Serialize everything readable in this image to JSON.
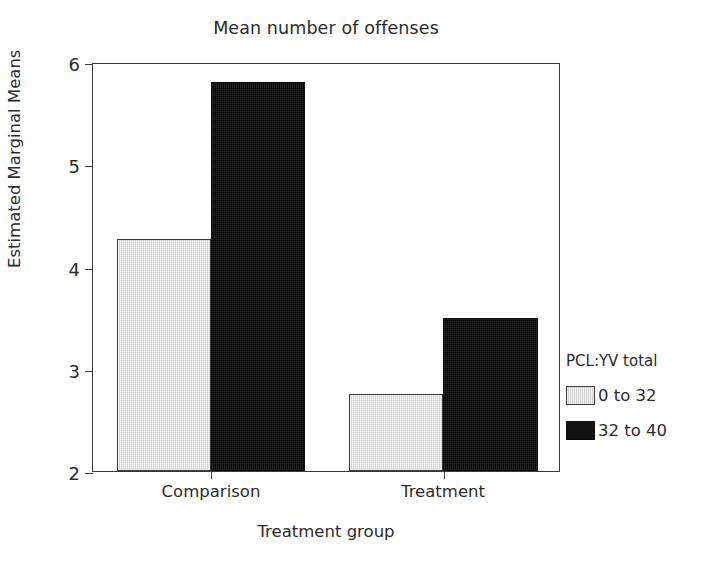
{
  "chart_data": {
    "type": "bar",
    "title": "Mean number of offenses",
    "xlabel": "Treatment group",
    "ylabel": "Estimated Marginal Means",
    "categories": [
      "Comparison",
      "Treatment"
    ],
    "series": [
      {
        "name": "0 to 32",
        "color": "#dcdcdc",
        "values": [
          4.27,
          2.75
        ]
      },
      {
        "name": "32 to 40",
        "color": "#121212",
        "values": [
          5.8,
          3.5
        ]
      }
    ],
    "legend_title": "PCL:YV total",
    "legend_position": "right",
    "ylim": [
      2,
      6
    ],
    "yticks": [
      2,
      3,
      4,
      5,
      6
    ],
    "ytick_labels": [
      "2",
      "3",
      "4",
      "5",
      "6"
    ],
    "grid": false
  }
}
